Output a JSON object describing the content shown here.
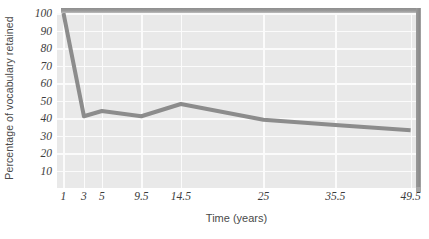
{
  "chart_data": {
    "type": "line",
    "title": "",
    "xlabel": "Time (years)",
    "ylabel": "Percentage of vocabulary retained",
    "x": [
      1,
      3,
      5,
      9.5,
      14.5,
      25,
      35.5,
      49.5
    ],
    "x_tick_labels": [
      "1",
      "3",
      "5",
      "9.5",
      "14.5",
      "25",
      "35.5",
      "49.5"
    ],
    "values": [
      100,
      41,
      44,
      41,
      48,
      39,
      36,
      33
    ],
    "y_tick_labels": [
      "10",
      "20",
      "30",
      "40",
      "50",
      "60",
      "70",
      "80",
      "90",
      "100"
    ],
    "y_ticks": [
      10,
      20,
      30,
      40,
      50,
      60,
      70,
      80,
      90,
      100
    ],
    "ylim": [
      0,
      100
    ],
    "grid": true,
    "legend": "none",
    "series_color": "#8c8c8c",
    "plot_background": "#e9e9e9",
    "gridline_color": "#fbfbfb",
    "bevel_color": "#8e8e8e"
  }
}
